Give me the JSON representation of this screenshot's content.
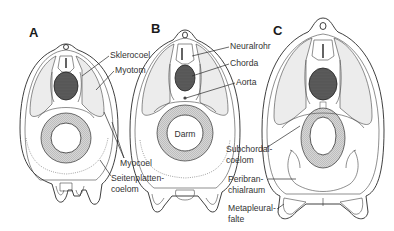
{
  "figure": {
    "panels": [
      {
        "id": "A",
        "letter": "A"
      },
      {
        "id": "B",
        "letter": "B"
      },
      {
        "id": "C",
        "letter": "C"
      }
    ],
    "labels": {
      "sklerocoel": "Sklerocoel",
      "myotom": "Myotom",
      "myocoel": "Myocoel",
      "seitenplatten_1": "Seitenplatten-",
      "seitenplatten_2": "coelom",
      "neuralrohr": "Neuralrohr",
      "chorda": "Chorda",
      "aorta": "Aorta",
      "darm": "Darm",
      "subchordal_1": "Subchordal-",
      "subchordal_2": "coelom",
      "peribranchial_1": "Peribran-",
      "peribranchial_2": "chialraum",
      "metapleural_1": "Metapleural-",
      "metapleural_2": "falte"
    },
    "colors": {
      "line": "#2a2a2a",
      "chorda_fill": "#5a5a5a",
      "hatch": "#9a9a9a",
      "text": "#333333"
    }
  }
}
